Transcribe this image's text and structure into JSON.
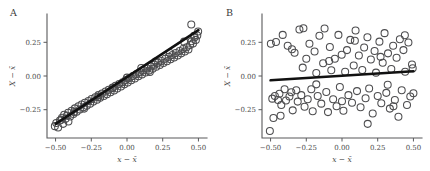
{
  "figure": {
    "background_color": "#ffffff",
    "point_stroke_color": "#4d4d4f",
    "fit_line_color": "#111111",
    "axis_color": "#59595b"
  },
  "axes": {
    "xlabel": "x − x̄",
    "ylabel": "X − x̄",
    "xticks": [
      "−0.50",
      "−0.25",
      "0.00",
      "0.25",
      "0.50"
    ],
    "xtick_values": [
      -0.5,
      -0.25,
      0,
      0.25,
      0.5
    ],
    "yticks": [
      "0.25",
      "0.00",
      "−0.25"
    ],
    "ytick_values": [
      0.25,
      0,
      -0.25
    ],
    "xlim": [
      -0.56,
      0.56
    ],
    "ylim": [
      -0.46,
      0.46
    ]
  },
  "panels": [
    {
      "id": "A",
      "label": "A",
      "name": "panel-a"
    },
    {
      "id": "B",
      "label": "B",
      "name": "panel-b"
    }
  ],
  "chart_data": [
    {
      "type": "scatter",
      "title": "A",
      "xlabel": "x − x̄",
      "ylabel": "X − x̄",
      "xlim": [
        -0.56,
        0.56
      ],
      "ylim": [
        -0.46,
        0.46
      ],
      "grid": false,
      "legend": "none",
      "description": "Strong positive linear relationship; points closely follow the fitted line.",
      "fit_line": {
        "x": [
          -0.5,
          0.5
        ],
        "y": [
          -0.355,
          0.34
        ],
        "slope": 0.695,
        "intercept": -0.0075
      },
      "x": [
        -0.505,
        -0.495,
        -0.482,
        -0.47,
        -0.455,
        -0.447,
        -0.44,
        -0.43,
        -0.421,
        -0.412,
        -0.398,
        -0.388,
        -0.375,
        -0.365,
        -0.352,
        -0.34,
        -0.33,
        -0.318,
        -0.305,
        -0.295,
        -0.282,
        -0.27,
        -0.258,
        -0.248,
        -0.235,
        -0.222,
        -0.21,
        -0.2,
        -0.188,
        -0.175,
        -0.162,
        -0.15,
        -0.14,
        -0.128,
        -0.115,
        -0.102,
        -0.09,
        -0.08,
        -0.068,
        -0.055,
        -0.042,
        -0.03,
        -0.018,
        -0.008,
        0.005,
        0.018,
        0.03,
        0.042,
        0.055,
        0.068,
        0.08,
        0.092,
        0.105,
        0.118,
        0.13,
        0.142,
        0.155,
        0.168,
        0.18,
        0.192,
        0.205,
        0.218,
        0.23,
        0.242,
        0.255,
        0.268,
        0.28,
        0.292,
        0.305,
        0.318,
        0.33,
        0.342,
        0.355,
        0.368,
        0.38,
        0.392,
        0.405,
        0.418,
        0.43,
        0.442,
        0.452,
        0.462,
        0.472,
        0.482,
        0.492,
        0.498,
        -0.46,
        -0.41,
        -0.3,
        -0.2,
        -0.1,
        0.0,
        0.1,
        0.2,
        0.3,
        0.4,
        0.45,
        0.47,
        -0.37,
        0.16
      ],
      "y": [
        -0.372,
        -0.348,
        -0.382,
        -0.33,
        -0.31,
        -0.355,
        -0.288,
        -0.318,
        -0.295,
        -0.272,
        -0.3,
        -0.258,
        -0.282,
        -0.24,
        -0.265,
        -0.225,
        -0.248,
        -0.212,
        -0.232,
        -0.198,
        -0.22,
        -0.185,
        -0.205,
        -0.17,
        -0.19,
        -0.158,
        -0.176,
        -0.142,
        -0.162,
        -0.13,
        -0.148,
        -0.115,
        -0.135,
        -0.102,
        -0.12,
        -0.09,
        -0.108,
        -0.072,
        -0.092,
        -0.06,
        -0.078,
        -0.046,
        -0.062,
        -0.03,
        -0.048,
        -0.015,
        -0.032,
        0.0,
        -0.018,
        0.014,
        -0.002,
        0.028,
        0.012,
        0.042,
        0.026,
        0.056,
        0.04,
        0.07,
        0.054,
        0.084,
        0.068,
        0.098,
        0.082,
        0.112,
        0.096,
        0.128,
        0.11,
        0.142,
        0.124,
        0.156,
        0.138,
        0.17,
        0.152,
        0.186,
        0.168,
        0.2,
        0.182,
        0.214,
        0.196,
        0.23,
        0.258,
        0.242,
        0.286,
        0.268,
        0.3,
        0.33,
        -0.325,
        -0.338,
        -0.242,
        -0.155,
        -0.085,
        -0.012,
        0.06,
        0.108,
        0.17,
        0.255,
        0.382,
        0.298,
        -0.268,
        0.03
      ]
    },
    {
      "type": "scatter",
      "title": "B",
      "xlabel": "x − x̄",
      "ylabel": "X − x̄",
      "xlim": [
        -0.56,
        0.56
      ],
      "ylim": [
        -0.46,
        0.46
      ],
      "grid": false,
      "legend": "none",
      "description": "No apparent relationship; points scatter broadly with a nearly flat fitted line.",
      "fit_line": {
        "x": [
          -0.5,
          0.5
        ],
        "y": [
          -0.032,
          0.035
        ],
        "slope": 0.067,
        "intercept": 0.0015
      },
      "x": [
        -0.505,
        -0.498,
        -0.488,
        -0.47,
        -0.462,
        -0.448,
        -0.438,
        -0.425,
        -0.415,
        -0.402,
        -0.392,
        -0.38,
        -0.368,
        -0.355,
        -0.345,
        -0.332,
        -0.32,
        -0.31,
        -0.298,
        -0.285,
        -0.275,
        -0.262,
        -0.25,
        -0.24,
        -0.228,
        -0.215,
        -0.205,
        -0.192,
        -0.18,
        -0.17,
        -0.158,
        -0.145,
        -0.132,
        -0.122,
        -0.11,
        -0.098,
        -0.085,
        -0.075,
        -0.062,
        -0.05,
        -0.038,
        -0.025,
        -0.015,
        -0.002,
        0.01,
        0.022,
        0.035,
        0.045,
        0.058,
        0.07,
        0.082,
        0.095,
        0.105,
        0.118,
        0.13,
        0.142,
        0.155,
        0.165,
        0.178,
        0.19,
        0.202,
        0.215,
        0.228,
        0.238,
        0.25,
        0.262,
        0.275,
        0.285,
        0.298,
        0.31,
        0.322,
        0.335,
        0.345,
        0.358,
        0.37,
        0.382,
        0.395,
        0.405,
        0.418,
        0.43,
        0.442,
        0.455,
        0.465,
        0.478,
        0.49,
        0.5,
        -0.43,
        -0.35,
        -0.27,
        -0.18,
        -0.09,
        0.0,
        0.09,
        0.18,
        0.27,
        0.36,
        0.44,
        0.495,
        -0.48,
        0.32
      ],
      "y": [
        -0.408,
        0.24,
        -0.168,
        -0.148,
        0.252,
        -0.178,
        -0.132,
        -0.215,
        0.305,
        -0.098,
        -0.182,
        0.225,
        -0.152,
        -0.12,
        -0.255,
        0.172,
        -0.105,
        -0.19,
        0.345,
        -0.142,
        0.062,
        -0.228,
        0.128,
        -0.172,
        0.24,
        -0.098,
        -0.262,
        0.182,
        0.022,
        -0.148,
        0.298,
        -0.205,
        0.095,
        0.352,
        -0.118,
        -0.268,
        0.215,
        0.042,
        -0.172,
        0.128,
        -0.225,
        0.305,
        -0.082,
        0.158,
        -0.258,
        0.032,
        0.192,
        -0.142,
        0.268,
        -0.198,
        0.078,
        0.338,
        -0.112,
        0.152,
        -0.232,
        0.045,
        0.212,
        -0.165,
        0.288,
        -0.092,
        0.122,
        -0.278,
        0.185,
        0.025,
        -0.148,
        0.255,
        -0.202,
        0.098,
        0.318,
        -0.125,
        0.168,
        -0.242,
        0.052,
        0.225,
        -0.178,
        0.135,
        -0.302,
        0.272,
        -0.105,
        0.192,
        0.032,
        -0.215,
        0.248,
        -0.152,
        0.085,
        -0.128,
        -0.295,
        0.198,
        0.355,
        -0.062,
        0.112,
        -0.188,
        0.262,
        -0.355,
        0.142,
        -0.225,
        0.302,
        0.058,
        -0.312,
        -0.065
      ]
    }
  ]
}
